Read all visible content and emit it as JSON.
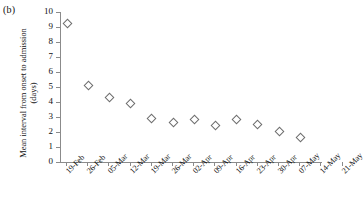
{
  "panel": {
    "label": "(b)"
  },
  "chart_data": {
    "type": "scatter",
    "title": "",
    "subtitle": "",
    "xlabel": "",
    "ylabel": "Mean interval from onset to admission\n(days)",
    "ylim": [
      0,
      10
    ],
    "ytick_labels": [
      "0",
      "1",
      "2",
      "3",
      "4",
      "5",
      "6",
      "7",
      "8",
      "9",
      "10"
    ],
    "ytick_values": [
      0,
      1,
      2,
      3,
      4,
      5,
      6,
      7,
      8,
      9,
      10
    ],
    "grid": false,
    "legend": null,
    "categories": [
      "19-Feb",
      "26-Feb",
      "05-Mar",
      "12-Mar",
      "19-Mar",
      "26-Mar",
      "02-Apr",
      "09-Apr",
      "16-Apr",
      "23-Apr",
      "30-Apr",
      "07-May",
      "14-May",
      "21-May"
    ],
    "series": [
      {
        "name": "Mean interval from onset to admission",
        "marker": "open-diamond",
        "color": "#6d6d6d",
        "points": [
          {
            "x": "19-Feb",
            "y": 9.3
          },
          {
            "x": "26-Feb",
            "y": 5.2
          },
          {
            "x": "05-Mar",
            "y": 4.4
          },
          {
            "x": "12-Mar",
            "y": 4.0
          },
          {
            "x": "19-Mar",
            "y": 3.0
          },
          {
            "x": "26-Mar",
            "y": 2.7
          },
          {
            "x": "02-Apr",
            "y": 2.9
          },
          {
            "x": "09-Apr",
            "y": 2.5
          },
          {
            "x": "16-Apr",
            "y": 2.9
          },
          {
            "x": "23-Apr",
            "y": 2.6
          },
          {
            "x": "30-Apr",
            "y": 2.1
          },
          {
            "x": "07-May",
            "y": 1.7
          }
        ]
      }
    ]
  },
  "axis_style": {
    "axis_color": "#8b8b8b",
    "marker_edge_color": "#6d6d6d",
    "marker_face_color": "#ffffff"
  }
}
